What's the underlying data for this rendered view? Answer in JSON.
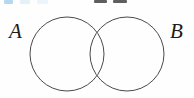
{
  "figure": {
    "kind": "venn-diagram",
    "set_count": 2,
    "background_color": "#fefefe",
    "stroke_color": "#4a4a4a",
    "stroke_width": 1,
    "labels": {
      "left_set": "A",
      "right_set": "B"
    },
    "circles": [
      {
        "name": "left-circle",
        "set": "A",
        "cx": 67,
        "cy": 54,
        "r": 37
      },
      {
        "name": "right-circle",
        "set": "B",
        "cx": 127,
        "cy": 54,
        "r": 37
      }
    ],
    "intersection_points": [
      {
        "x": 97,
        "y": 19
      },
      {
        "x": 97,
        "y": 89
      }
    ],
    "notes": {
      "cropped_bottom": "circles extend past the bottom edge of the image",
      "cropped_top": "partial text fragments cut off along the top edge"
    }
  },
  "artifacts": {
    "top_left_blue": "faint blue cropped marks",
    "top_center_dark": "dark cropped text fragments"
  }
}
